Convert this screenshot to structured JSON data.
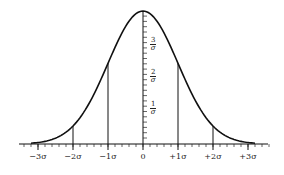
{
  "chart_data": {
    "type": "line",
    "title": "",
    "xlabel": "",
    "ylabel": "",
    "x_ticks": [
      "−3σ",
      "−2σ",
      "−1σ",
      "0",
      "+1σ",
      "+2σ",
      "+3σ"
    ],
    "y_ticks": [
      {
        "num": "1",
        "den": "σ"
      },
      {
        "num": "2",
        "den": "σ"
      },
      {
        "num": "3",
        "den": "σ"
      }
    ],
    "vertical_lines_at": [
      -2,
      -1,
      1,
      2
    ],
    "xlim": [
      -3.2,
      3.6
    ],
    "grid": false,
    "legend": null
  }
}
